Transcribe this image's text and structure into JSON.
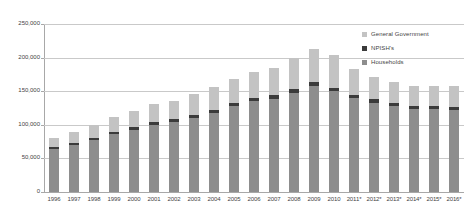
{
  "chart_data": {
    "type": "bar",
    "subtype": "stacked-bar",
    "title": "",
    "xlabel": "",
    "ylabel": "",
    "ylim": [
      0,
      250000
    ],
    "ytick_labels": [
      "250,000",
      "200,000",
      "150,000",
      "100,000",
      "50,000",
      "0"
    ],
    "ytick_values": [
      250000,
      200000,
      150000,
      100000,
      50000,
      0
    ],
    "grid": true,
    "legend_position": "top-right",
    "categories": [
      "1996",
      "1997",
      "1998",
      "1999",
      "2000",
      "2001",
      "2002",
      "2003",
      "2004",
      "2005",
      "2006",
      "2007",
      "2008",
      "2009",
      "2010",
      "2011*",
      "2012*",
      "2013*",
      "2014*",
      "2015*",
      "2016*"
    ],
    "series": [
      {
        "name": "Households",
        "color": "#8d8d8d",
        "values": [
          64000,
          70000,
          78000,
          86000,
          93000,
          100000,
          104000,
          110000,
          118000,
          128000,
          135000,
          139000,
          148000,
          158000,
          150000,
          140000,
          133000,
          128000,
          124000,
          123000,
          122000
        ]
      },
      {
        "name": "NPISH's",
        "color": "#3b3b3b",
        "values": [
          3000,
          3000,
          3000,
          3500,
          3500,
          3500,
          4000,
          4000,
          4500,
          4500,
          5000,
          5000,
          5500,
          5500,
          5500,
          5000,
          5000,
          4500,
          4500,
          4500,
          4500
        ]
      },
      {
        "name": "General Government",
        "color": "#c3c3c3",
        "values": [
          14000,
          17000,
          19000,
          22000,
          24000,
          27000,
          28000,
          32000,
          34000,
          35000,
          38000,
          40000,
          46000,
          49000,
          48000,
          38000,
          33000,
          31000,
          30000,
          30000,
          32000
        ]
      }
    ],
    "totals": [
      81000,
      90000,
      100000,
      111500,
      120500,
      130500,
      136000,
      146000,
      156500,
      167500,
      178000,
      184000,
      199500,
      212500,
      203500,
      183000,
      171000,
      163500,
      158500,
      157500,
      158500
    ]
  },
  "legend": {
    "items": [
      {
        "label": "General Government",
        "color": "#c3c3c3"
      },
      {
        "label": "NPISH's",
        "color": "#3b3b3b"
      },
      {
        "label": "Households",
        "color": "#8d8d8d"
      }
    ]
  }
}
